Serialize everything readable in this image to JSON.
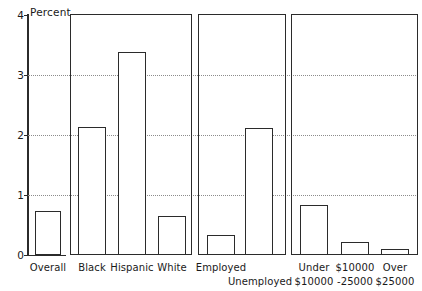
{
  "chart_data": {
    "type": "bar",
    "title": "",
    "subtitle": "",
    "xlabel": "",
    "ylabel": "Percent",
    "ylim": [
      0,
      4
    ],
    "yticks": [
      0,
      1,
      2,
      3,
      4
    ],
    "ytick_labels": [
      "0",
      "1",
      "2",
      "3",
      "4"
    ],
    "grid": "horizontal dotted gridlines at 1, 2, 3",
    "legend": "none",
    "legend_position": "none",
    "orientation": "vertical",
    "bar_style": "white fill, black outline",
    "panels": [
      {
        "name": "overall",
        "categories": [
          "Overall"
        ],
        "values": [
          0.73
        ]
      },
      {
        "name": "race-ethnicity",
        "categories": [
          "Black",
          "Hispanic",
          "White"
        ],
        "values": [
          2.13,
          3.38,
          0.65
        ]
      },
      {
        "name": "employment-status",
        "categories": [
          "Employed",
          "Unemployed"
        ],
        "values": [
          0.33,
          2.12
        ]
      },
      {
        "name": "household-income",
        "categories": [
          "Under $10000",
          "$10000 -25000",
          "Over $25000"
        ],
        "values": [
          0.83,
          0.22,
          0.1
        ]
      }
    ],
    "categories": [
      "Overall",
      "Black",
      "Hispanic",
      "White",
      "Employed",
      "Unemployed",
      "Under $10000",
      "$10000 -25000",
      "Over $25000"
    ],
    "values": [
      0.73,
      2.13,
      3.38,
      0.65,
      0.33,
      2.12,
      0.83,
      0.22,
      0.1
    ]
  },
  "axis": {
    "y_title": "Percent",
    "tick_4": "4",
    "tick_3": "3",
    "tick_2": "2",
    "tick_1": "1",
    "tick_0": "0"
  },
  "labels": {
    "overall": "Overall",
    "black": "Black",
    "hispanic": "Hispanic",
    "white": "White",
    "employed": "Employed",
    "unemployed": "Unemployed",
    "under_10000_line1": "Under",
    "under_10000_line2": "$10000",
    "mid_income_line1": "$10000",
    "mid_income_line2": "-25000",
    "over_25000_line1": "Over",
    "over_25000_line2": "$25000"
  },
  "colors": {
    "ink": "#2b2b2b",
    "grid": "#8c8c8c",
    "bar_fill": "#ffffff",
    "background": "#ffffff"
  }
}
